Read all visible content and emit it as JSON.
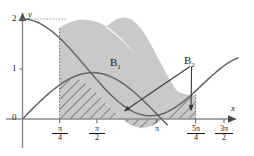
{
  "figure": {
    "background": "#ffffff",
    "width": 254,
    "height": 156
  },
  "axes": {
    "x_axis_label": "x",
    "y_axis_label": "y",
    "x_label_name": "x-axis-label",
    "y_label_name": "y-axis-label",
    "origin_label": "0",
    "y_ticks": [
      {
        "value": 2,
        "label": "2"
      },
      {
        "value": 1,
        "label": "1"
      },
      {
        "value": 0,
        "label": "0"
      }
    ],
    "x_ticks": [
      {
        "value": 0.7853981634,
        "numerator": "π",
        "denominator": "4",
        "label": "π/4"
      },
      {
        "value": 1.5707963268,
        "numerator": "π",
        "denominator": "2",
        "label": "π/2"
      },
      {
        "value": 3.1415926536,
        "numerator": "π",
        "denominator": "",
        "label": "π"
      },
      {
        "value": 3.926990817,
        "numerator": "5π",
        "denominator": "4",
        "label": "5π/4"
      },
      {
        "value": 4.7123889804,
        "numerator": "3π",
        "denominator": "2",
        "label": "3π/2"
      }
    ],
    "xlim": [
      -0.35,
      5.25
    ],
    "ylim": [
      -0.38,
      2.35
    ],
    "grid": false,
    "axis_color": "#8a8a8a"
  },
  "regions": [
    {
      "id": "B1",
      "label": "B",
      "sub": "1",
      "fill": "#c8c8c8",
      "style": "solid-gray",
      "description": "Region between curve y=1+cos(x) above and y=2sin(x) below, from pi/4 to 5pi/4"
    },
    {
      "id": "B2",
      "label": "B",
      "sub": "2",
      "fill": "#c8c8c8",
      "style": "hatched",
      "description": "Region under y=2sin(x) above the x-axis from pi/4 to 5pi/4, hatched with diagonal lines"
    }
  ],
  "curves": [
    {
      "name": "cosine-curve",
      "expression": "1 + cos(x)",
      "color": "#555555",
      "peak": {
        "x": 0,
        "y": 2
      },
      "note": "starts at y=2 on y-axis, decreasing to 0 at pi then rising"
    },
    {
      "name": "sine-curve",
      "expression": "2 sin(x)",
      "color": "#555555",
      "peak": {
        "x": 1.5707963268,
        "y": 2
      },
      "note": "rises from 1 at x=0 region, crosses, falls to 0, then rises again after 3pi/2"
    }
  ],
  "annotations": [
    {
      "name": "b1-label",
      "text": "B",
      "sub": "1",
      "x": 2.35,
      "y": 1.08
    },
    {
      "name": "b2-label",
      "text": "B",
      "sub": "2",
      "x": 4.05,
      "y": 1.35
    }
  ],
  "arrows": [
    {
      "name": "b2-arrow-diagonal",
      "from": {
        "x": 4.0,
        "y": 1.2
      },
      "to": {
        "x": 2.45,
        "y": 0.18
      },
      "color": "#3a3a3a"
    },
    {
      "name": "b2-arrow-vertical",
      "from": {
        "x": 4.02,
        "y": 1.2
      },
      "to": {
        "x": 3.86,
        "y": 0.16
      },
      "color": "#3a3a3a"
    }
  ],
  "guides": [
    {
      "name": "dotted-guide-pi-over-4",
      "x": 0.7853981634,
      "y_from": 0,
      "y_to": 1.707,
      "style": "dotted"
    },
    {
      "name": "dotted-guide-5pi-over-4",
      "x": 3.926990817,
      "y_from": 0,
      "y_to": 0.293,
      "style": "dotted"
    },
    {
      "name": "dotted-guide-y2",
      "y": 2,
      "style": "dotted"
    }
  ],
  "intersections": [
    {
      "name": "intersection-left",
      "x": 0.7853981634,
      "y": 1.7071
    },
    {
      "name": "intersection-right",
      "x": 3.926990817,
      "y": 0.2929
    }
  ]
}
